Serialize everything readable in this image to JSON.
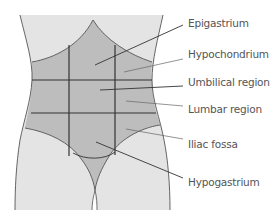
{
  "diagram": {
    "colors": {
      "background": "#ffffff",
      "body_fill": "#e4e4e4",
      "region_fill": "#bdbdbd",
      "outline": "#555555",
      "grid_line": "#333333",
      "leader_line": "#444444",
      "label_text": "#555555"
    },
    "labels": [
      {
        "id": "epigastrium",
        "text": "Epigastrium",
        "x": 188,
        "y": 17
      },
      {
        "id": "hypochondrium",
        "text": "Hypochondrium",
        "x": 188,
        "y": 48
      },
      {
        "id": "umbilical",
        "text": "Umbilical region",
        "x": 188,
        "y": 76
      },
      {
        "id": "lumbar",
        "text": "Lumbar region",
        "x": 188,
        "y": 103
      },
      {
        "id": "iliac",
        "text": "Iliac fossa",
        "x": 188,
        "y": 138
      },
      {
        "id": "hypogastrium",
        "text": "Hypogastrium",
        "x": 188,
        "y": 176
      }
    ]
  }
}
